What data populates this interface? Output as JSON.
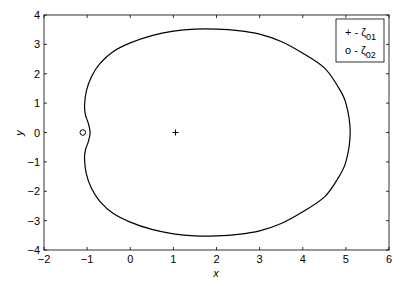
{
  "chart_data": {
    "type": "line",
    "title": "",
    "xlabel": "x",
    "ylabel": "y",
    "xlim": [
      -2,
      6
    ],
    "ylim": [
      -4,
      4
    ],
    "xticks": [
      -2,
      -1,
      0,
      1,
      2,
      3,
      4,
      5,
      6
    ],
    "yticks": [
      -4,
      -3,
      -2,
      -1,
      0,
      1,
      2,
      3,
      4
    ],
    "grid": false,
    "legend_position": "upper right",
    "series": [
      {
        "name": "boundary curve",
        "style": "solid",
        "color": "#000000",
        "closed": true,
        "x": [
          5.1,
          5.0,
          4.8,
          4.5,
          4.0,
          3.5,
          3.0,
          2.5,
          2.0,
          1.5,
          1.0,
          0.5,
          0.0,
          -0.4,
          -0.7,
          -0.9,
          -1.02,
          -1.06,
          -1.04,
          -0.97,
          -0.93,
          -0.97,
          -1.04,
          -1.06,
          -1.02,
          -0.9,
          -0.7,
          -0.4,
          0.0,
          0.5,
          1.0,
          1.5,
          2.0,
          2.5,
          3.0,
          3.5,
          4.0,
          4.5,
          4.8,
          5.0
        ],
        "y": [
          0.0,
          1.0,
          1.6,
          2.2,
          2.7,
          3.1,
          3.35,
          3.47,
          3.52,
          3.52,
          3.45,
          3.3,
          3.05,
          2.75,
          2.35,
          1.9,
          1.4,
          0.9,
          0.6,
          0.3,
          0.0,
          -0.3,
          -0.6,
          -0.9,
          -1.4,
          -1.9,
          -2.35,
          -2.75,
          -3.05,
          -3.3,
          -3.45,
          -3.52,
          -3.52,
          -3.47,
          -3.35,
          -3.1,
          -2.7,
          -2.2,
          -1.6,
          -1.0
        ]
      },
      {
        "name": "ζ01",
        "legend_label": "+ - ζ01",
        "marker": "+",
        "x": [
          1.05
        ],
        "y": [
          0
        ]
      },
      {
        "name": "ζ02",
        "legend_label": "o - ζ02",
        "marker": "o",
        "x": [
          -1.1
        ],
        "y": [
          0
        ]
      }
    ],
    "legend": [
      {
        "marker": "+",
        "text": "+ - ",
        "symbol": "ζ",
        "subscript": "01"
      },
      {
        "marker": "o",
        "text": "o - ",
        "symbol": "ζ",
        "subscript": "02"
      }
    ]
  }
}
